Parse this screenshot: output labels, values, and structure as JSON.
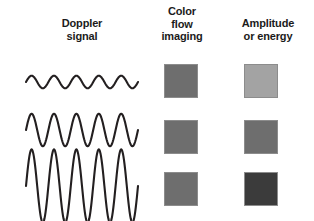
{
  "figure": {
    "background_color": "#ffffff",
    "wave_stroke_color": "#231f20",
    "swatch_border_color": "#8c8c8c"
  },
  "columns": [
    {
      "id": "doppler-signal",
      "header_lines": [
        "Doppler",
        "signal"
      ]
    },
    {
      "id": "color-flow-imaging",
      "header_lines": [
        "Color",
        "flow",
        "imaging"
      ]
    },
    {
      "id": "amplitude-or-energy",
      "header_lines": [
        "Amplitude",
        "or energy"
      ]
    }
  ],
  "rows": [
    {
      "id": "row-low",
      "waveform": {
        "cycles": 5,
        "amplitude_relative": 0.28,
        "description": "low amplitude sine wave"
      },
      "color_flow_swatch": "#6e6e6e",
      "amplitude_swatch": "#a3a3a3"
    },
    {
      "id": "row-medium",
      "waveform": {
        "cycles": 5,
        "amplitude_relative": 0.6,
        "description": "medium amplitude sine wave"
      },
      "color_flow_swatch": "#6e6e6e",
      "amplitude_swatch": "#6e6e6e"
    },
    {
      "id": "row-high",
      "waveform": {
        "cycles": 5,
        "amplitude_relative": 1.0,
        "description": "high amplitude sine wave"
      },
      "color_flow_swatch": "#6e6e6e",
      "amplitude_swatch": "#3b3b3b"
    }
  ],
  "chart_data": {
    "type": "line",
    "title": "",
    "xlabel": "",
    "ylabel": "",
    "series": [
      {
        "name": "Doppler signal - low amplitude",
        "cycles": 5,
        "amplitude": 0.28
      },
      {
        "name": "Doppler signal - medium amplitude",
        "cycles": 5,
        "amplitude": 0.6
      },
      {
        "name": "Doppler signal - high amplitude",
        "cycles": 5,
        "amplitude": 1.0
      }
    ],
    "swatch_matrix": {
      "columns": [
        "Color flow imaging",
        "Amplitude or energy"
      ],
      "rows": [
        "low",
        "medium",
        "high"
      ],
      "values": [
        [
          "#6e6e6e",
          "#a3a3a3"
        ],
        [
          "#6e6e6e",
          "#6e6e6e"
        ],
        [
          "#6e6e6e",
          "#3b3b3b"
        ]
      ]
    }
  }
}
